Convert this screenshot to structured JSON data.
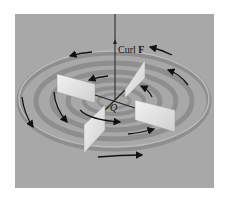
{
  "figure": {
    "background_color": "#ffffff",
    "panel_color": "#a8a8a8",
    "ring_dark_color": "#8a8a8a",
    "ring_light_color": "#bdbdbd",
    "vane_color": "#e6e6e6",
    "arrow_color": "#111111"
  },
  "labels": {
    "curl_text": "Curl ",
    "curl_vector": "F",
    "origin": "Q"
  }
}
